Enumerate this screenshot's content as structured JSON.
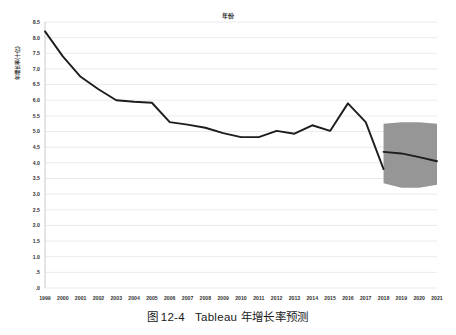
{
  "figure": {
    "caption_label": "图",
    "caption_number": "12-4",
    "caption_text": "Tableau 年增长率预测"
  },
  "chart_data": {
    "type": "line",
    "title": "年份",
    "xlabel": "",
    "ylabel": "年增长率(十亿)",
    "grid": true,
    "legend": "none",
    "xlim": [
      1999,
      2021
    ],
    "ylim": [
      0,
      8.5
    ],
    "ytick_labels": [
      "8.5",
      "8.0",
      "7.5",
      "7.0",
      "6.5",
      "6.0",
      "5.5",
      "5.0",
      "4.5",
      "4.0",
      "3.5",
      "3.0",
      "2.5",
      "2.0",
      "1.5",
      "1.0",
      ".5",
      ".0"
    ],
    "ytick_values": [
      8.5,
      8.0,
      7.5,
      7.0,
      6.5,
      6.0,
      5.5,
      5.0,
      4.5,
      4.0,
      3.5,
      3.0,
      2.5,
      2.0,
      1.5,
      1.0,
      0.5,
      0.0
    ],
    "categories": [
      "1999",
      "2000",
      "2001",
      "2002",
      "2003",
      "2004",
      "2005",
      "2006",
      "2007",
      "2008",
      "2009",
      "2010",
      "2011",
      "2012",
      "2013",
      "2014",
      "2015",
      "2016",
      "2017",
      "2018",
      "2019",
      "2020",
      "2021"
    ],
    "series": [
      {
        "name": "年增长率",
        "kind": "actual",
        "x": [
          1999,
          2000,
          2001,
          2002,
          2003,
          2004,
          2005,
          2006,
          2007,
          2008,
          2009,
          2010,
          2011,
          2012,
          2013,
          2014,
          2015,
          2016,
          2017,
          2018
        ],
        "values": [
          8.2,
          7.4,
          6.75,
          6.35,
          6.0,
          5.95,
          5.92,
          5.3,
          5.22,
          5.12,
          4.95,
          4.82,
          4.82,
          5.02,
          4.93,
          5.2,
          5.02,
          5.9,
          5.3,
          3.8
        ]
      },
      {
        "name": "预测值",
        "kind": "forecast",
        "x": [
          2018,
          2019,
          2020,
          2021
        ],
        "values": [
          4.35,
          4.3,
          4.18,
          4.05
        ]
      }
    ],
    "forecast_band": {
      "name": "预测区间",
      "x": [
        2018,
        2019,
        2020,
        2021
      ],
      "upper": [
        5.25,
        5.3,
        5.3,
        5.25
      ],
      "lower": [
        3.35,
        3.2,
        3.2,
        3.3
      ],
      "color": "#8d8d8d"
    },
    "colors": {
      "line": "#1d1d1d",
      "grid": "#e3e3e3",
      "band": "#8d8d8d",
      "text": "#333333"
    }
  }
}
